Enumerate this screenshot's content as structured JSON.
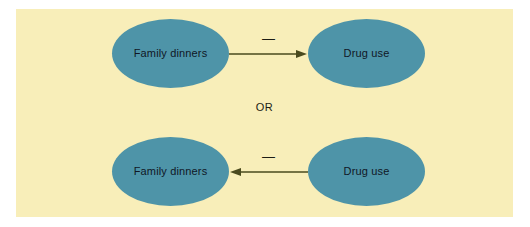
{
  "figure": {
    "panel_background": "#f8eeb9",
    "page_background": "#ffffff",
    "node_fill": "#4e94a8",
    "arrow_color": "#4a4a1e",
    "label_color": "#101726",
    "connector_label": "OR"
  },
  "diagram": {
    "type": "causal-direction",
    "alternatives": [
      {
        "id": "top",
        "direction": "right",
        "from_label": "Family dinners",
        "to_label": "Drug use",
        "relation_sign": "—",
        "relation_meaning": "negative"
      },
      {
        "id": "bottom",
        "direction": "left",
        "from_label": "Drug use",
        "to_label": "Family dinners",
        "relation_sign": "—",
        "relation_meaning": "negative"
      }
    ],
    "rows": {
      "top": {
        "left_node": "Family dinners",
        "right_node": "Drug use",
        "arrow_sign": "—"
      },
      "bottom": {
        "left_node": "Family dinners",
        "right_node": "Drug use",
        "arrow_sign": "—"
      }
    }
  }
}
